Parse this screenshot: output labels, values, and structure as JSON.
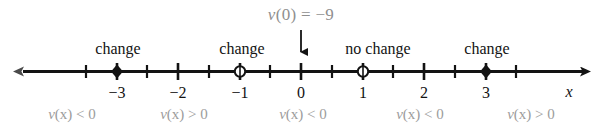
{
  "figure": {
    "type": "number-line-sign-chart",
    "axis_label": "x",
    "callout": {
      "text": "v(0) = −9",
      "points_to": 0,
      "color": "#8f8f8f"
    },
    "axis": {
      "min": -3.85,
      "max": 3.9,
      "tick_labels": [
        {
          "value": -3,
          "label": "−3"
        },
        {
          "value": -2,
          "label": "−2"
        },
        {
          "value": -1,
          "label": "−1"
        },
        {
          "value": 0,
          "label": "0"
        },
        {
          "value": 1,
          "label": "1"
        },
        {
          "value": 2,
          "label": "2"
        },
        {
          "value": 3,
          "label": "3"
        }
      ],
      "minor_ticks": [
        -3.5,
        -2.5,
        -1.5,
        -0.5,
        0.5,
        1.5,
        2.5,
        3.5
      ],
      "line_color": "#131313",
      "arrow_left": true,
      "arrow_right": true
    },
    "markers": [
      {
        "value": -3,
        "style": "filled",
        "label": "change"
      },
      {
        "value": -1,
        "style": "open",
        "label": "change"
      },
      {
        "value": 1,
        "style": "open",
        "label": "no change"
      },
      {
        "value": 3,
        "style": "filled",
        "label": "change"
      }
    ],
    "change_labels": [
      {
        "at": -3,
        "text": "change"
      },
      {
        "at": -1,
        "text": "change"
      },
      {
        "at": 1,
        "text": "no change"
      },
      {
        "at": 3,
        "text": "change"
      }
    ],
    "sign_labels": [
      {
        "at": -3.0,
        "text": "v(x) < 0"
      },
      {
        "at": -1.85,
        "text": "v(x) > 0"
      },
      {
        "at": -0.35,
        "text": "v(x) < 0"
      },
      {
        "at": 1.3,
        "text": "v(x) < 0"
      },
      {
        "at": 2.8,
        "text": "v(x) > 0"
      }
    ],
    "colors": {
      "ink": "#131313",
      "muted": "#9c9c9c",
      "callout": "#8f8f8f",
      "background": "#ffffff"
    }
  },
  "chart_data": {
    "type": "line",
    "title": "",
    "xlabel": "x",
    "ylabel": "",
    "xlim": [
      -3.85,
      3.9
    ],
    "grid": false,
    "legend": "none",
    "x": [
      -3,
      -2,
      -1,
      0,
      1,
      2,
      3
    ],
    "tick_labels": [
      "−3",
      "−2",
      "−1",
      "0",
      "1",
      "2",
      "3"
    ],
    "annotations": [
      "v(0) = −9",
      "change",
      "change",
      "no change",
      "change",
      "v(x) < 0",
      "v(x) > 0",
      "v(x) < 0",
      "v(x) < 0",
      "v(x) > 0"
    ],
    "critical_points": [
      {
        "x": -3,
        "marker": "filled",
        "behavior": "change",
        "sign_left": "v(x) < 0",
        "sign_right": "v(x) > 0"
      },
      {
        "x": -1,
        "marker": "open",
        "behavior": "change",
        "sign_left": "v(x) > 0",
        "sign_right": "v(x) < 0"
      },
      {
        "x": 1,
        "marker": "open",
        "behavior": "no change",
        "sign_left": "v(x) < 0",
        "sign_right": "v(x) < 0"
      },
      {
        "x": 3,
        "marker": "filled",
        "behavior": "change",
        "sign_left": "v(x) < 0",
        "sign_right": "v(x) > 0"
      }
    ],
    "intervals": [
      {
        "range": "(-inf, -3)",
        "sign": "v(x) < 0"
      },
      {
        "range": "(-3, -1)",
        "sign": "v(x) > 0"
      },
      {
        "range": "(-1, 1)",
        "sign": "v(x) < 0"
      },
      {
        "range": "(1, 3)",
        "sign": "v(x) < 0"
      },
      {
        "range": "(3, inf)",
        "sign": "v(x) > 0"
      }
    ]
  }
}
